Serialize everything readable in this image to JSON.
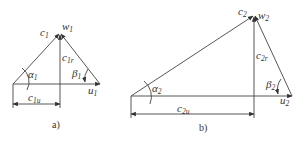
{
  "diagram": {
    "type": "velocity-triangles",
    "panels": [
      {
        "id": "a",
        "caption": "a)",
        "labels": {
          "c": "c",
          "c_sub": "1",
          "w": "w",
          "w_sub": "1",
          "cr": "c",
          "cr_sub": "1r",
          "cu": "c",
          "cu_sub": "1u",
          "u": "u",
          "u_sub": "1",
          "alpha": "α",
          "alpha_sub": "1",
          "beta": "β",
          "beta_sub": "1"
        }
      },
      {
        "id": "b",
        "caption": "b)",
        "labels": {
          "c": "c",
          "c_sub": "2",
          "w": "w",
          "w_sub": "2",
          "cr": "c",
          "cr_sub": "2r",
          "cu": "c",
          "cu_sub": "2u",
          "u": "u",
          "u_sub": "2",
          "alpha": "α",
          "alpha_sub": "2",
          "beta": "β",
          "beta_sub": "2"
        }
      }
    ]
  }
}
